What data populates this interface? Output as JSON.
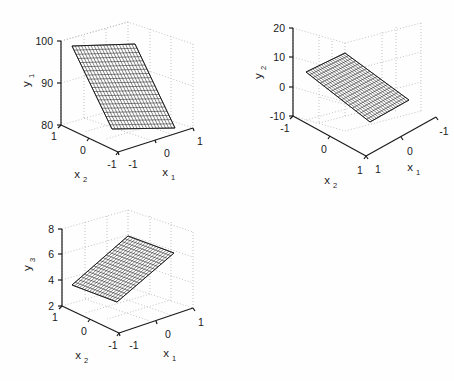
{
  "figure": {
    "type": "multi-panel-3d-surface-plot",
    "background_color": "#fefefe",
    "axis_color": "#1a1a1a",
    "grid_color": "#b4b4b4",
    "mesh_edge_color": "#222222",
    "mesh_face_color": "#ffffff",
    "panel_count": 3
  },
  "chart_data": [
    {
      "type": "surface",
      "id": "panel1",
      "title": "",
      "zlabel": "y_1",
      "zlabel_base": "y",
      "zlabel_sub": "1",
      "xlabel": "x_1",
      "xlabel_base": "x",
      "xlabel_sub": "1",
      "ylabel": "x_2",
      "ylabel_base": "x",
      "ylabel_sub": "2",
      "zticks": [
        80,
        90,
        100
      ],
      "ztick_labels": [
        "80",
        "90",
        "100"
      ],
      "zlim": [
        80,
        100
      ],
      "xticks": [
        -1,
        0,
        1
      ],
      "xtick_labels": [
        "-1",
        "0",
        "1"
      ],
      "xlim": [
        -1,
        1
      ],
      "yticks": [
        -1,
        0,
        1
      ],
      "ytick_labels": [
        "1",
        "0",
        "-1"
      ],
      "ylim": [
        -1,
        1
      ],
      "grid": true,
      "mesh_n": 20,
      "corner_values": {
        "x1-1_x2-1": 80.0,
        "x1+1_x2-1": 100.0,
        "x1-1_x2+1": 80.0,
        "x1+1_x2+1": 100.0
      },
      "note": "planar surface rising with x_1"
    },
    {
      "type": "surface",
      "id": "panel2",
      "title": "",
      "zlabel": "y_2",
      "zlabel_base": "y",
      "zlabel_sub": "2",
      "xlabel": "x_1",
      "xlabel_base": "x",
      "xlabel_sub": "1",
      "ylabel": "x_2",
      "ylabel_base": "x",
      "ylabel_sub": "2",
      "zticks": [
        -10,
        0,
        10,
        20
      ],
      "ztick_labels": [
        "-10",
        "0",
        "10",
        "20"
      ],
      "zlim": [
        -10,
        20
      ],
      "xticks": [
        1,
        0,
        -1
      ],
      "xtick_labels": [
        "1",
        "0",
        "-1"
      ],
      "xlim": [
        -1,
        1
      ],
      "yticks": [
        -1,
        0,
        1
      ],
      "ytick_labels": [
        "-1",
        "0",
        "1"
      ],
      "ylim": [
        -1,
        1
      ],
      "grid": true,
      "mesh_n": 18,
      "corner_values": {
        "x1-1_x2-1": 10.0,
        "x1+1_x2-1": 8.0,
        "x1-1_x2+1": 4.0,
        "x1+1_x2+1": 2.0
      },
      "note": "nearly flat plane around y=5, reversed view azimuth"
    },
    {
      "type": "surface",
      "id": "panel3",
      "title": "",
      "zlabel": "y_3",
      "zlabel_base": "y",
      "zlabel_sub": "3",
      "xlabel": "x_1",
      "xlabel_base": "x",
      "xlabel_sub": "1",
      "ylabel": "x_2",
      "ylabel_base": "x",
      "ylabel_sub": "2",
      "zticks": [
        2,
        4,
        6,
        8
      ],
      "ztick_labels": [
        "2",
        "4",
        "6",
        "8"
      ],
      "zlim": [
        2,
        8
      ],
      "xticks": [
        -1,
        0,
        1
      ],
      "xtick_labels": [
        "-1",
        "0",
        "1"
      ],
      "xlim": [
        -1,
        1
      ],
      "yticks": [
        -1,
        0,
        1
      ],
      "ytick_labels": [
        "1",
        "0",
        "-1"
      ],
      "ylim": [
        -1,
        1
      ],
      "grid": true,
      "mesh_n": 18,
      "corner_values": {
        "x1-1_x2-1": 3.4,
        "x1+1_x2-1": 6.9,
        "x1-1_x2+1": 3.4,
        "x1+1_x2+1": 6.9
      },
      "note": "planar tilted surface rising with x_1"
    }
  ]
}
